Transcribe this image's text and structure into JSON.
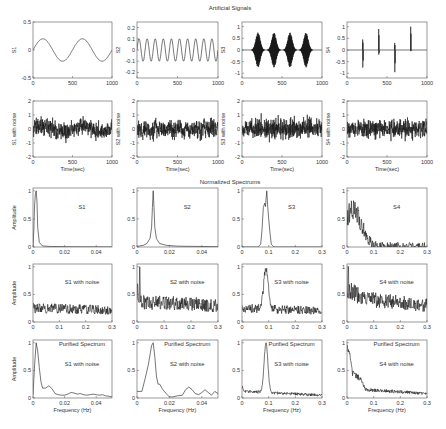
{
  "figure": {
    "section_titles": [
      {
        "text": "Artificial Signals",
        "x": 230,
        "y": 5
      },
      {
        "text": "Normalized Spectrums",
        "x": 230,
        "y": 179
      }
    ],
    "colors": {
      "line": "#1a1a1a",
      "axis": "#555555",
      "text": "#333333",
      "background": "#ffffff"
    }
  },
  "chart_data": [
    {
      "id": "s1",
      "type": "line",
      "row": 0,
      "col": 0,
      "ylabel": "S1",
      "xlabel": "",
      "annotations": [],
      "xlim": [
        0,
        1000
      ],
      "ylim": [
        -0.5,
        0.5
      ],
      "xticks": [
        0,
        500,
        1000
      ],
      "yticks": [
        -0.5,
        0,
        0.5
      ],
      "series": {
        "kind": "sine",
        "amplitude": 0.2,
        "cycles": 2.0,
        "phase": 0
      }
    },
    {
      "id": "s2",
      "type": "line",
      "row": 0,
      "col": 1,
      "ylabel": "S2",
      "xlabel": "",
      "annotations": [],
      "xlim": [
        0,
        1000
      ],
      "ylim": [
        -0.25,
        0.25
      ],
      "xticks": [
        0,
        500,
        1000
      ],
      "yticks": [
        -0.2,
        -0.1,
        0,
        0.1,
        0.2
      ],
      "series": {
        "kind": "sine",
        "amplitude": 0.1,
        "cycles": 10.0,
        "phase": 0
      }
    },
    {
      "id": "s3",
      "type": "line",
      "row": 0,
      "col": 2,
      "ylabel": "S3",
      "xlabel": "",
      "annotations": [],
      "xlim": [
        0,
        1000
      ],
      "ylim": [
        -1.2,
        1.2
      ],
      "xticks": [
        0,
        500,
        1000
      ],
      "yticks": [
        -1,
        -0.5,
        0,
        0.5,
        1
      ],
      "series": {
        "kind": "bursts",
        "centers": [
          200,
          400,
          600,
          800
        ],
        "width": 55,
        "amplitude": 0.75,
        "freq": 0.09
      }
    },
    {
      "id": "s4",
      "type": "line",
      "row": 0,
      "col": 3,
      "ylabel": "S4",
      "xlabel": "",
      "annotations": [],
      "xlim": [
        0,
        1000
      ],
      "ylim": [
        -1.2,
        1.2
      ],
      "xticks": [
        0,
        500,
        1000
      ],
      "yticks": [
        -1,
        -0.5,
        0,
        0.5,
        1
      ],
      "series": {
        "kind": "spikes",
        "spikes": [
          [
            200,
            0.45,
            -0.75
          ],
          [
            400,
            0.9,
            -0.2
          ],
          [
            600,
            0.3,
            -0.95
          ],
          [
            800,
            1.0,
            -0.05
          ]
        ]
      }
    },
    {
      "id": "s1n",
      "type": "line",
      "row": 1,
      "col": 0,
      "ylabel": "S1 with noise",
      "xlabel": "Time(sec)",
      "annotations": [],
      "xlim": [
        0,
        1000
      ],
      "ylim": [
        -2,
        2
      ],
      "xticks": [
        0,
        500,
        1000
      ],
      "yticks": [
        -2,
        -1,
        0,
        1,
        2
      ],
      "series": {
        "kind": "noisy",
        "base": "sine",
        "amplitude": 0.2,
        "cycles": 2.0,
        "noise": 0.45,
        "seed": 11
      }
    },
    {
      "id": "s2n",
      "type": "line",
      "row": 1,
      "col": 1,
      "ylabel": "S2 with noise",
      "xlabel": "Time(sec)",
      "annotations": [],
      "xlim": [
        0,
        1000
      ],
      "ylim": [
        -2,
        2
      ],
      "xticks": [
        0,
        500,
        1000
      ],
      "yticks": [
        -2,
        -1,
        0,
        1,
        2
      ],
      "series": {
        "kind": "noisy",
        "base": "sine",
        "amplitude": 0.1,
        "cycles": 10.0,
        "noise": 0.45,
        "seed": 23
      }
    },
    {
      "id": "s3n",
      "type": "line",
      "row": 1,
      "col": 2,
      "ylabel": "S3 with noise",
      "xlabel": "Time(sec)",
      "annotations": [],
      "xlim": [
        0,
        1000
      ],
      "ylim": [
        -2,
        2
      ],
      "xticks": [
        0,
        500,
        1000
      ],
      "yticks": [
        -2,
        -1,
        0,
        1,
        2
      ],
      "series": {
        "kind": "noisy",
        "base": "zero",
        "noise": 0.5,
        "seed": 37
      }
    },
    {
      "id": "s4n",
      "type": "line",
      "row": 1,
      "col": 3,
      "ylabel": "S4 with noise",
      "xlabel": "Time(sec)",
      "annotations": [],
      "xlim": [
        0,
        1000
      ],
      "ylim": [
        -2,
        2
      ],
      "xticks": [
        0,
        500,
        1000
      ],
      "yticks": [
        -2,
        -1,
        0,
        1,
        2
      ],
      "series": {
        "kind": "noisy",
        "base": "zero",
        "noise": 0.45,
        "seed": 51
      }
    },
    {
      "id": "spec_s1",
      "type": "line",
      "row": 2,
      "col": 0,
      "ylabel": "Amplitude",
      "xlabel": "",
      "annotations": [
        "S1"
      ],
      "xlim": [
        0,
        0.05
      ],
      "ylim": [
        0,
        1.05
      ],
      "xticks": [
        0,
        0.02,
        0.04
      ],
      "yticks": [
        0,
        0.5,
        1
      ],
      "series": {
        "kind": "points",
        "x": [
          0,
          0.0005,
          0.001,
          0.0015,
          0.002,
          0.0025,
          0.003,
          0.004,
          0.006,
          0.01,
          0.02,
          0.03,
          0.05
        ],
        "y": [
          0,
          0.3,
          0.75,
          0.95,
          1.0,
          0.8,
          0.35,
          0.08,
          0.02,
          0.01,
          0.005,
          0.003,
          0.002
        ]
      }
    },
    {
      "id": "spec_s2",
      "type": "line",
      "row": 2,
      "col": 1,
      "ylabel": "",
      "xlabel": "",
      "annotations": [
        "S2"
      ],
      "xlim": [
        0,
        0.05
      ],
      "ylim": [
        0,
        1.05
      ],
      "xticks": [
        0,
        0.02,
        0.04
      ],
      "yticks": [
        0,
        0.5,
        1
      ],
      "series": {
        "kind": "points",
        "x": [
          0,
          0.004,
          0.006,
          0.008,
          0.009,
          0.0095,
          0.01,
          0.0105,
          0.011,
          0.012,
          0.014,
          0.018,
          0.025,
          0.05
        ],
        "y": [
          0.01,
          0.03,
          0.06,
          0.15,
          0.35,
          0.7,
          1.0,
          0.7,
          0.35,
          0.15,
          0.06,
          0.03,
          0.015,
          0.005
        ]
      }
    },
    {
      "id": "spec_s3",
      "type": "line",
      "row": 2,
      "col": 2,
      "ylabel": "",
      "xlabel": "",
      "annotations": [
        "S3"
      ],
      "xlim": [
        0,
        0.3
      ],
      "ylim": [
        0,
        1.05
      ],
      "xticks": [
        0,
        0.1,
        0.2,
        0.3
      ],
      "yticks": [
        0,
        0.5,
        1
      ],
      "series": {
        "kind": "points",
        "x": [
          0,
          0.06,
          0.07,
          0.075,
          0.08,
          0.085,
          0.088,
          0.09,
          0.093,
          0.096,
          0.1,
          0.105,
          0.11,
          0.12,
          0.3
        ],
        "y": [
          0,
          0,
          0.05,
          0.3,
          0.7,
          0.78,
          0.72,
          0.85,
          1.0,
          0.75,
          0.5,
          0.25,
          0.05,
          0,
          0
        ]
      }
    },
    {
      "id": "spec_s4",
      "type": "line",
      "row": 2,
      "col": 3,
      "ylabel": "",
      "xlabel": "",
      "annotations": [
        "S4"
      ],
      "xlim": [
        0,
        0.3
      ],
      "ylim": [
        0,
        1.05
      ],
      "xticks": [
        0,
        0.1,
        0.2,
        0.3
      ],
      "yticks": [
        0,
        0.5,
        1
      ],
      "series": {
        "kind": "noisyenv",
        "env": [
          [
            0,
            0.55
          ],
          [
            0.02,
            0.65
          ],
          [
            0.04,
            0.6
          ],
          [
            0.06,
            0.35
          ],
          [
            0.08,
            0.12
          ],
          [
            0.1,
            0.02
          ],
          [
            0.3,
            0.0
          ]
        ],
        "noise": 0.4,
        "seed": 71
      }
    },
    {
      "id": "spec_s1n",
      "type": "line",
      "row": 3,
      "col": 0,
      "ylabel": "Amplitude",
      "xlabel": "",
      "annotations": [
        "S1 with noise"
      ],
      "xlim": [
        0,
        0.3
      ],
      "ylim": [
        0,
        1.05
      ],
      "xticks": [
        0,
        0.1,
        0.2,
        0.3
      ],
      "yticks": [
        0,
        0.5,
        1
      ],
      "series": {
        "kind": "noisyenv",
        "env": [
          [
            0,
            0.25
          ],
          [
            0.3,
            0.22
          ]
        ],
        "noise": 0.28,
        "seed": 83
      }
    },
    {
      "id": "spec_s2n",
      "type": "line",
      "row": 3,
      "col": 1,
      "ylabel": "",
      "xlabel": "",
      "annotations": [
        "S2 with noise"
      ],
      "xlim": [
        0,
        0.3
      ],
      "ylim": [
        0,
        1.05
      ],
      "xticks": [
        0,
        0.1,
        0.2,
        0.3
      ],
      "yticks": [
        0,
        0.5,
        1
      ],
      "series": {
        "kind": "noisyenv",
        "env": [
          [
            0,
            0.55
          ],
          [
            0.02,
            0.35
          ],
          [
            0.1,
            0.35
          ],
          [
            0.3,
            0.3
          ]
        ],
        "noise": 0.35,
        "seed": 97,
        "peak": [
          0.01,
          1.0
        ]
      }
    },
    {
      "id": "spec_s3n",
      "type": "line",
      "row": 3,
      "col": 2,
      "ylabel": "",
      "xlabel": "",
      "annotations": [
        "S3 with noise"
      ],
      "xlim": [
        0,
        0.3
      ],
      "ylim": [
        0,
        1.05
      ],
      "xticks": [
        0,
        0.1,
        0.2,
        0.3
      ],
      "yticks": [
        0,
        0.5,
        1
      ],
      "series": {
        "kind": "noisyenv",
        "env": [
          [
            0,
            0.25
          ],
          [
            0.3,
            0.2
          ]
        ],
        "noise": 0.25,
        "seed": 101,
        "bump": [
          0.09,
          0.012,
          0.75
        ]
      }
    },
    {
      "id": "spec_s4n",
      "type": "line",
      "row": 3,
      "col": 3,
      "ylabel": "",
      "xlabel": "",
      "annotations": [
        "S4 with noise"
      ],
      "xlim": [
        0,
        0.3
      ],
      "ylim": [
        0,
        1.05
      ],
      "xticks": [
        0,
        0.1,
        0.2,
        0.3
      ],
      "yticks": [
        0,
        0.5,
        1
      ],
      "series": {
        "kind": "noisyenv",
        "env": [
          [
            0,
            0.6
          ],
          [
            0.05,
            0.45
          ],
          [
            0.1,
            0.4
          ],
          [
            0.3,
            0.3
          ]
        ],
        "noise": 0.35,
        "seed": 113,
        "peak": [
          0.005,
          1.0
        ]
      }
    },
    {
      "id": "pur_s1n",
      "type": "line",
      "row": 4,
      "col": 0,
      "ylabel": "Amplitude",
      "xlabel": "Frequency (Hz)",
      "annotations": [
        "Purified Spectrum",
        "S1 with noise"
      ],
      "xlim": [
        0,
        0.05
      ],
      "ylim": [
        0,
        1.05
      ],
      "xticks": [
        0,
        0.02,
        0.04
      ],
      "yticks": [
        0,
        0.5,
        1
      ],
      "series": {
        "kind": "points",
        "x": [
          0,
          0.001,
          0.002,
          0.003,
          0.004,
          0.005,
          0.006,
          0.008,
          0.01,
          0.012,
          0.014,
          0.016,
          0.018,
          0.02,
          0.022,
          0.024,
          0.026,
          0.028,
          0.03,
          0.032,
          0.034,
          0.036,
          0.038,
          0.04,
          0.042,
          0.044,
          0.046,
          0.048,
          0.05
        ],
        "y": [
          0.05,
          0.6,
          1.0,
          0.85,
          0.55,
          0.3,
          0.18,
          0.18,
          0.22,
          0.17,
          0.08,
          0.06,
          0.05,
          0.05,
          0.07,
          0.1,
          0.09,
          0.07,
          0.08,
          0.06,
          0.05,
          0.06,
          0.07,
          0.06,
          0.05,
          0.06,
          0.04,
          0.03,
          0.02
        ]
      }
    },
    {
      "id": "pur_s2n",
      "type": "line",
      "row": 4,
      "col": 1,
      "ylabel": "",
      "xlabel": "Frequency (Hz)",
      "annotations": [
        "Purified Spectrum",
        "S2 with noise"
      ],
      "xlim": [
        0,
        0.05
      ],
      "ylim": [
        0,
        1.05
      ],
      "xticks": [
        0,
        0.02,
        0.04
      ],
      "yticks": [
        0,
        0.5,
        1
      ],
      "series": {
        "kind": "points",
        "x": [
          0,
          0.003,
          0.005,
          0.007,
          0.009,
          0.01,
          0.011,
          0.012,
          0.013,
          0.014,
          0.016,
          0.018,
          0.02,
          0.022,
          0.025,
          0.028,
          0.03,
          0.032,
          0.034,
          0.036,
          0.038,
          0.04,
          0.042,
          0.044,
          0.046,
          0.048,
          0.05
        ],
        "y": [
          0.12,
          0.12,
          0.35,
          0.6,
          0.95,
          1.0,
          0.75,
          0.4,
          0.25,
          0.25,
          0.15,
          0.08,
          0.02,
          0.02,
          0.04,
          0.05,
          0.15,
          0.2,
          0.15,
          0.08,
          0.06,
          0.1,
          0.15,
          0.1,
          0.05,
          0.12,
          0.08
        ]
      }
    },
    {
      "id": "pur_s3n",
      "type": "line",
      "row": 4,
      "col": 2,
      "ylabel": "",
      "xlabel": "Frequency (Hz)",
      "annotations": [
        "Purified Spectrum",
        "S3 with noise"
      ],
      "xlim": [
        0,
        0.3
      ],
      "ylim": [
        0,
        1.05
      ],
      "xticks": [
        0,
        0.1,
        0.2,
        0.3
      ],
      "yticks": [
        0,
        0.5,
        1
      ],
      "series": {
        "kind": "noisyenv",
        "env": [
          [
            0,
            0.2
          ],
          [
            0.01,
            0.12
          ],
          [
            0.3,
            0.05
          ]
        ],
        "noise": 0.1,
        "seed": 131,
        "bump": [
          0.09,
          0.01,
          0.9
        ]
      }
    },
    {
      "id": "pur_s4n",
      "type": "line",
      "row": 4,
      "col": 3,
      "ylabel": "",
      "xlabel": "Frequency (Hz)",
      "annotations": [
        "Purified Spectrum",
        "S4 with noise"
      ],
      "xlim": [
        0,
        0.3
      ],
      "ylim": [
        0,
        1.05
      ],
      "xticks": [
        0,
        0.1,
        0.2,
        0.3
      ],
      "yticks": [
        0,
        0.5,
        1
      ],
      "series": {
        "kind": "noisyenv",
        "env": [
          [
            0,
            0.9
          ],
          [
            0.01,
            0.8
          ],
          [
            0.02,
            0.45
          ],
          [
            0.05,
            0.35
          ],
          [
            0.07,
            0.15
          ],
          [
            0.3,
            0.08
          ]
        ],
        "noise": 0.12,
        "seed": 149
      }
    }
  ],
  "layout": {
    "cols_x": [
      [
        33,
        112
      ],
      [
        137,
        218
      ],
      [
        242,
        322
      ],
      [
        347,
        427
      ]
    ],
    "rows_y": [
      [
        22,
        78
      ],
      [
        101,
        157
      ],
      [
        188,
        247
      ],
      [
        264,
        322
      ],
      [
        340,
        398
      ]
    ]
  }
}
